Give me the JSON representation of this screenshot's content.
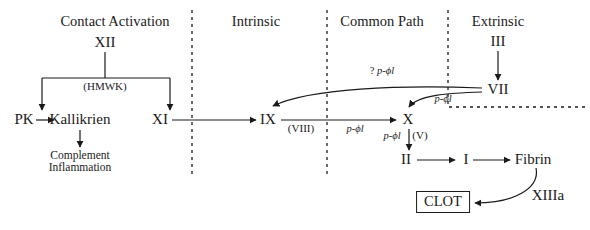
{
  "diagram": {
    "ink_color": "#1a1a1a",
    "background": "#ffffff",
    "sections": [
      {
        "id": "contact",
        "label": "Contact Activation",
        "x": 115,
        "y": 22
      },
      {
        "id": "intrinsic",
        "label": "Intrinsic",
        "x": 256,
        "y": 22
      },
      {
        "id": "common",
        "label": "Common Path",
        "x": 382,
        "y": 22
      },
      {
        "id": "extrinsic",
        "label": "Extrinsic",
        "x": 498,
        "y": 22
      }
    ],
    "nodes": [
      {
        "id": "xii",
        "label": "XII",
        "x": 105,
        "y": 43,
        "style": "node-main"
      },
      {
        "id": "pk",
        "label": "PK",
        "x": 24,
        "y": 120,
        "style": "node-main"
      },
      {
        "id": "kallikrien",
        "label": "Kallikrien",
        "x": 80,
        "y": 120,
        "style": "node-main"
      },
      {
        "id": "xi",
        "label": "XI",
        "x": 160,
        "y": 120,
        "style": "node-main"
      },
      {
        "id": "ix",
        "label": "IX",
        "x": 268,
        "y": 120,
        "style": "node-main"
      },
      {
        "id": "x",
        "label": "X",
        "x": 408,
        "y": 120,
        "style": "node-main"
      },
      {
        "id": "ii",
        "label": "II",
        "x": 406,
        "y": 160,
        "style": "node-main"
      },
      {
        "id": "i",
        "label": "I",
        "x": 466,
        "y": 160,
        "style": "node-main"
      },
      {
        "id": "fibrin",
        "label": "Fibrin",
        "x": 533,
        "y": 160,
        "style": "node-main"
      },
      {
        "id": "iii",
        "label": "III",
        "x": 498,
        "y": 42,
        "style": "node-main"
      },
      {
        "id": "vii",
        "label": "VII",
        "x": 498,
        "y": 90,
        "style": "node-main"
      },
      {
        "id": "xiiia",
        "label": "XIIIa",
        "x": 548,
        "y": 196,
        "style": "node-main"
      }
    ],
    "clot": {
      "label": "CLOT",
      "x": 443,
      "y": 202
    },
    "outcome": {
      "line1": "Complement",
      "line2": "Inflammation",
      "x": 80,
      "y": 161
    },
    "cofactors": [
      {
        "id": "hmwk",
        "label": "(HMWK)",
        "x": 105,
        "y": 87,
        "style": "cofactor"
      },
      {
        "id": "viii",
        "label": "(VIII)",
        "x": 301,
        "y": 129,
        "style": "cofactor"
      },
      {
        "id": "v",
        "label": "(V)",
        "x": 420,
        "y": 136,
        "style": "cofactor"
      }
    ],
    "phospholipid_labels": [
      {
        "id": "pl-ix-x",
        "prefix": "",
        "label": "p-ϕl",
        "x": 355,
        "y": 129
      },
      {
        "id": "pl-x-ii",
        "prefix": "",
        "label": "p-ϕl",
        "x": 392,
        "y": 136
      },
      {
        "id": "pl-vii-x",
        "prefix": "",
        "label": "p-ϕl",
        "x": 443,
        "y": 99
      },
      {
        "id": "pl-vii-ix",
        "prefix": "? ",
        "label": "p-ϕl",
        "x": 382,
        "y": 71
      }
    ],
    "dividers": [
      {
        "id": "divider-contact-intrinsic",
        "type": "vertical",
        "x": 192,
        "y1": 10,
        "y2": 176
      },
      {
        "id": "divider-intrinsic-common",
        "type": "vertical",
        "x": 327,
        "y1": 10,
        "y2": 176
      },
      {
        "id": "divider-extrinsic",
        "type": "lshape",
        "x": 448,
        "y1": 10,
        "y_corner": 107,
        "x2": 586
      }
    ]
  }
}
